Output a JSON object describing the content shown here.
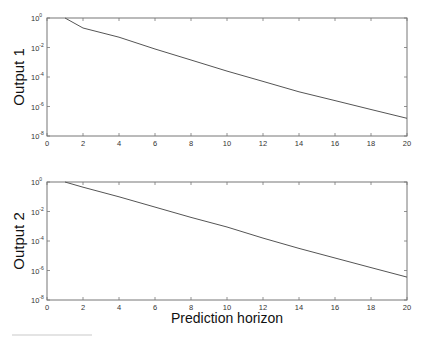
{
  "chart_data": [
    {
      "type": "line",
      "title": "",
      "xlabel": "",
      "ylabel": "Output 1",
      "yscale": "log",
      "xlim": [
        0,
        20
      ],
      "ylim": [
        1e-08,
        1
      ],
      "xticks": [
        0,
        2,
        4,
        6,
        8,
        10,
        12,
        14,
        16,
        18,
        20
      ],
      "yticks": [
        "10^0",
        "10^-2",
        "10^-4",
        "10^-6",
        "10^-8"
      ],
      "grid": false,
      "x": [
        1,
        2,
        4,
        6,
        8,
        10,
        12,
        14,
        16,
        18,
        20
      ],
      "series": [
        {
          "name": "Output 1",
          "log10_values": [
            0,
            -0.68,
            -1.3,
            -2.1,
            -2.85,
            -3.6,
            -4.3,
            -5.0,
            -5.6,
            -6.2,
            -6.8
          ],
          "values": [
            1,
            0.21,
            0.05,
            0.0079,
            0.0014,
            0.00025,
            5e-05,
            1e-05,
            2.5e-06,
            6.3e-07,
            1.6e-07
          ]
        }
      ]
    },
    {
      "type": "line",
      "title": "",
      "xlabel": "Prediction horizon",
      "ylabel": "Output 2",
      "yscale": "log",
      "xlim": [
        0,
        20
      ],
      "ylim": [
        1e-08,
        1
      ],
      "xticks": [
        0,
        2,
        4,
        6,
        8,
        10,
        12,
        14,
        16,
        18,
        20
      ],
      "yticks": [
        "10^0",
        "10^-2",
        "10^-4",
        "10^-6",
        "10^-8"
      ],
      "grid": false,
      "x": [
        1,
        2,
        4,
        6,
        8,
        10,
        12,
        14,
        16,
        18,
        20
      ],
      "series": [
        {
          "name": "Output 2",
          "log10_values": [
            0,
            -0.35,
            -1.0,
            -1.7,
            -2.4,
            -3.05,
            -3.8,
            -4.5,
            -5.15,
            -5.8,
            -6.45
          ],
          "values": [
            1,
            0.45,
            0.1,
            0.02,
            0.004,
            0.00089,
            0.00016,
            3.2e-05,
            7.1e-06,
            1.6e-06,
            3.5e-07
          ]
        }
      ]
    }
  ],
  "labels": {
    "output1": "Output 1",
    "output2": "Output 2",
    "xaxis": "Prediction horizon"
  },
  "xtick_labels": [
    "0",
    "2",
    "4",
    "6",
    "8",
    "10",
    "12",
    "14",
    "16",
    "18",
    "20"
  ],
  "ytick_labels": [
    {
      "base": "10",
      "exp": "0"
    },
    {
      "base": "10",
      "exp": "-2"
    },
    {
      "base": "10",
      "exp": "-4"
    },
    {
      "base": "10",
      "exp": "-6"
    },
    {
      "base": "10",
      "exp": "-8"
    }
  ],
  "colors": {
    "line": "#555555",
    "axis": "#777777"
  }
}
